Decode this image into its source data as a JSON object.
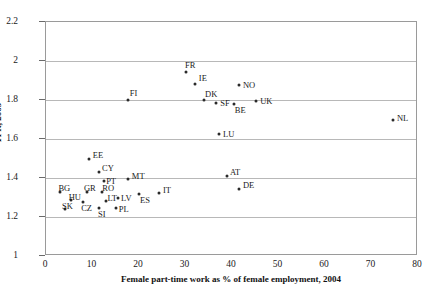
{
  "chart_data": {
    "type": "scatter",
    "title": "",
    "xlabel": "Female part-time work as %  of female employment,  2004",
    "ylabel": "TFR, 2005",
    "xlim": [
      0,
      80
    ],
    "ylim": [
      1,
      2.2
    ],
    "xticks": [
      "0",
      "10",
      "20",
      "30",
      "40",
      "50",
      "60",
      "70",
      "80"
    ],
    "yticks": [
      "1",
      "1.2",
      "1.4",
      "1.6",
      "1.8",
      "2",
      "2.2"
    ],
    "grid": "horizontal",
    "legend": "none",
    "points": [
      {
        "label": "FR",
        "x": 30.1,
        "y": 1.943,
        "lx": -1,
        "ly": -11
      },
      {
        "label": "IE",
        "x": 32.0,
        "y": 1.882,
        "lx": 4,
        "ly": -10
      },
      {
        "label": "FI",
        "x": 17.6,
        "y": 1.8,
        "lx": 2,
        "ly": -11
      },
      {
        "label": "DK",
        "x": 34.0,
        "y": 1.8,
        "lx": 1,
        "ly": -10
      },
      {
        "label": "SF",
        "x": 36.6,
        "y": 1.786,
        "lx": 4,
        "ly": -4
      },
      {
        "label": "NO",
        "x": 41.5,
        "y": 1.878,
        "lx": 4,
        "ly": -4
      },
      {
        "label": "UK",
        "x": 45.2,
        "y": 1.795,
        "lx": 4,
        "ly": -4
      },
      {
        "label": "BE",
        "x": 40.4,
        "y": 1.78,
        "lx": 1,
        "ly": 2
      },
      {
        "label": "LU",
        "x": 37.2,
        "y": 1.625,
        "lx": 4,
        "ly": -4
      },
      {
        "label": "NL",
        "x": 74.6,
        "y": 1.695,
        "lx": 4,
        "ly": -6
      },
      {
        "label": "EE",
        "x": 9.2,
        "y": 1.5,
        "lx": 4,
        "ly": -8
      },
      {
        "label": "CY",
        "x": 11.4,
        "y": 1.432,
        "lx": 3,
        "ly": -8
      },
      {
        "label": "PT",
        "x": 12.5,
        "y": 1.387,
        "lx": 2,
        "ly": -4
      },
      {
        "label": "MT",
        "x": 17.6,
        "y": 1.395,
        "lx": 4,
        "ly": -7
      },
      {
        "label": "AT",
        "x": 38.9,
        "y": 1.41,
        "lx": 3,
        "ly": -8
      },
      {
        "label": "DE",
        "x": 41.5,
        "y": 1.343,
        "lx": 4,
        "ly": -8
      },
      {
        "label": "IT",
        "x": 24.3,
        "y": 1.325,
        "lx": 4,
        "ly": -7
      },
      {
        "label": "ES",
        "x": 20.0,
        "y": 1.32,
        "lx": 1,
        "ly": 2
      },
      {
        "label": "BG",
        "x": 3.1,
        "y": 1.33,
        "lx": -2,
        "ly": -8
      },
      {
        "label": "GR",
        "x": 8.8,
        "y": 1.33,
        "lx": -3,
        "ly": -8
      },
      {
        "label": "RO",
        "x": 12.1,
        "y": 1.33,
        "lx": 0,
        "ly": -8
      },
      {
        "label": "HU",
        "x": 5.3,
        "y": 1.285,
        "lx": -2,
        "ly": -7
      },
      {
        "label": "CZ",
        "x": 8.0,
        "y": 1.275,
        "lx": -2,
        "ly": 2
      },
      {
        "label": "LT",
        "x": 13.0,
        "y": 1.28,
        "lx": 1,
        "ly": -7
      },
      {
        "label": "LV",
        "x": 15.5,
        "y": 1.295,
        "lx": 3,
        "ly": -4
      },
      {
        "label": "SK",
        "x": 4.1,
        "y": 1.24,
        "lx": -3,
        "ly": -7
      },
      {
        "label": "SI",
        "x": 11.4,
        "y": 1.245,
        "lx": -1,
        "ly": 2
      },
      {
        "label": "PL",
        "x": 15.0,
        "y": 1.245,
        "lx": 3,
        "ly": -3
      }
    ]
  },
  "style": {
    "point_color": "#2a2a2a",
    "grid_color": "#b8b8b8",
    "frame_color": "#9a9a9a",
    "text_color": "#1a1a1a"
  }
}
